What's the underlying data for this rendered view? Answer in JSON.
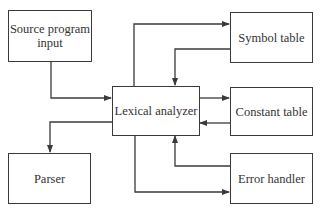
{
  "diagram": {
    "nodes": {
      "source": {
        "label": "Source program input"
      },
      "symbol": {
        "label": "Symbol table"
      },
      "lexical": {
        "label": "Lexical analyzer"
      },
      "constant": {
        "label": "Constant table"
      },
      "parser": {
        "label": "Parser"
      },
      "error": {
        "label": "Error handler"
      }
    },
    "edges": [
      {
        "from": "Source program input",
        "to": "Lexical analyzer"
      },
      {
        "from": "Lexical analyzer",
        "to": "Symbol table"
      },
      {
        "from": "Symbol table",
        "to": "Lexical analyzer"
      },
      {
        "from": "Lexical analyzer",
        "to": "Constant table"
      },
      {
        "from": "Constant table",
        "to": "Lexical analyzer"
      },
      {
        "from": "Lexical analyzer",
        "to": "Parser"
      },
      {
        "from": "Lexical analyzer",
        "to": "Error handler"
      },
      {
        "from": "Error handler",
        "to": "Lexical analyzer"
      }
    ],
    "colors": {
      "line": "#3a3a3a",
      "text": "#333333",
      "background": "#ffffff"
    }
  }
}
